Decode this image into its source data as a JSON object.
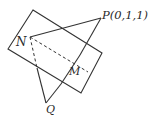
{
  "diagram": {
    "type": "geometry",
    "colors": {
      "stroke": "#333333",
      "background": "#ffffff"
    },
    "plane": {
      "corners": [
        [
          33,
          10
        ],
        [
          102,
          53
        ],
        [
          81,
          93
        ],
        [
          8,
          49
        ]
      ]
    },
    "points": {
      "N": {
        "label": "N",
        "xy": [
          30,
          37
        ]
      },
      "P": {
        "label": "P(0,1,1)",
        "xy": [
          101,
          18
        ]
      },
      "M": {
        "label": "M",
        "xy": [
          73,
          62
        ]
      },
      "Q": {
        "label": "Q",
        "xy": [
          46,
          103
        ]
      }
    },
    "segments": [
      {
        "from": "N",
        "to": "P",
        "style": "solid"
      },
      {
        "from": "P",
        "to": "Q",
        "style": "solid-then-hidden"
      },
      {
        "from": "N",
        "to": "Q",
        "style": "dashed-then-solid"
      },
      {
        "from": "N",
        "to": "M",
        "style": "dashed"
      }
    ]
  }
}
